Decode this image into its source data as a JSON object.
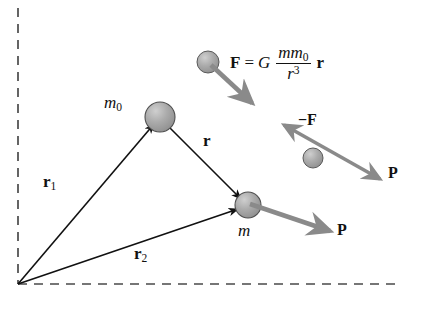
{
  "diagram": {
    "background": "#ffffff",
    "axes": {
      "style": "dashed",
      "color": "#4a4a4a",
      "vertical_x": 18,
      "horizontal_y": 284,
      "vertical_top": 8,
      "horizontal_right": 400,
      "origin": {
        "x": 18,
        "y": 284
      }
    },
    "colors": {
      "line": "#111111",
      "gray_arrow": "#8a8a8a",
      "sphere_fill": "#a8a8a8",
      "sphere_edge": "#555555",
      "dashed_axis": "#4a4a4a"
    },
    "bodies": [
      {
        "name": "mass-m0",
        "label": "m",
        "subscript": "0",
        "cx": 160,
        "cy": 117,
        "r": 15
      },
      {
        "name": "mass-m",
        "label": "m",
        "subscript": "",
        "cx": 248,
        "cy": 205,
        "r": 13
      },
      {
        "name": "sphere-force-illustration",
        "label": "",
        "subscript": "",
        "cx": 208,
        "cy": 62,
        "r": 11
      },
      {
        "name": "sphere-reaction-illustration",
        "label": "",
        "subscript": "",
        "cx": 313,
        "cy": 158,
        "r": 10
      }
    ],
    "vectors": [
      {
        "name": "position-vector-r1",
        "label": "r",
        "subscript": "1",
        "from": {
          "x": 18,
          "y": 284
        },
        "to": {
          "x": 160,
          "y": 117
        }
      },
      {
        "name": "position-vector-r2",
        "label": "r",
        "subscript": "2",
        "from": {
          "x": 18,
          "y": 284
        },
        "to": {
          "x": 248,
          "y": 205
        }
      },
      {
        "name": "separation-vector-r",
        "label": "r",
        "subscript": "",
        "from": {
          "x": 160,
          "y": 117
        },
        "to": {
          "x": 248,
          "y": 205
        }
      },
      {
        "name": "force-vector-F",
        "label": "F",
        "subscript": "",
        "from": {
          "x": 214,
          "y": 68
        },
        "to": {
          "x": 253,
          "y": 104
        }
      },
      {
        "name": "reaction-vector-negF",
        "label": "−F",
        "subscript": "",
        "from": {
          "x": 318,
          "y": 155
        },
        "to": {
          "x": 283,
          "y": 124
        }
      },
      {
        "name": "momentum-vector-P-upper",
        "label": "P",
        "subscript": "",
        "from": {
          "x": 308,
          "y": 160
        },
        "to": {
          "x": 383,
          "y": 180
        }
      },
      {
        "name": "momentum-vector-P-lower",
        "label": "P",
        "subscript": "",
        "from": {
          "x": 250,
          "y": 204
        },
        "to": {
          "x": 332,
          "y": 232
        }
      }
    ],
    "labels": {
      "m0": "m",
      "m0_sub": "0",
      "m": "m",
      "r1": "r",
      "r1_sub": "1",
      "r2": "r",
      "r2_sub": "2",
      "r": "r",
      "neg_f": "−F",
      "p_upper": "P",
      "p_lower": "P"
    },
    "formula": {
      "lhs": "F",
      "equals": "=",
      "constant": "G",
      "numerator_m": "m",
      "numerator_m0": "m",
      "numerator_m0_sub": "0",
      "denominator_r": "r",
      "denominator_exp": "3",
      "trailing_vector": "r",
      "plain_text": "F = G mm0 / r^3 r"
    }
  }
}
